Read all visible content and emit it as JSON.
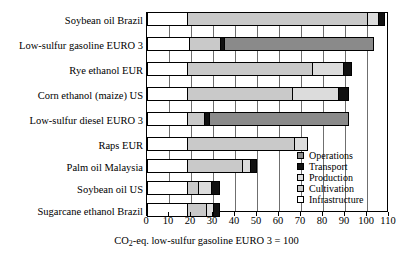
{
  "chart_data": {
    "type": "bar",
    "orientation": "horizontal",
    "stacked": true,
    "title": "",
    "xlabel": "CO2-eq. low-sulfur gasoline EURO 3 = 100",
    "xlabel_parts": {
      "pre": "CO",
      "sub": "2",
      "post": "-eq. low-sulfur gasoline EURO 3 = 100"
    },
    "ylabel": "",
    "xlim": [
      0,
      110
    ],
    "xticks": [
      0,
      10,
      20,
      30,
      40,
      50,
      60,
      70,
      80,
      90,
      100,
      110
    ],
    "xtick_labels": [
      "0",
      "10",
      "20",
      "30",
      "40",
      "50",
      "60",
      "70",
      "80",
      "90",
      "100",
      "110"
    ],
    "grid": true,
    "grid_axis": "x",
    "legend_position": "inside-right",
    "categories": [
      "Soybean oil Brazil",
      "Low-sulfur gasoline EURO 3",
      "Rye ethanol EUR",
      "Corn ethanol (maize) US",
      "Low-sulfur diesel EURO 3",
      "Raps EUR",
      "Palm oil Malaysia",
      "Soybean oil US",
      "Sugarcane ethanol Brazil"
    ],
    "series": [
      {
        "name": "Infrastructure",
        "color": "#ffffff",
        "values": [
          18,
          19,
          18,
          18,
          18,
          18,
          18,
          18,
          18
        ]
      },
      {
        "name": "Cultivation",
        "color": "#c9c9c9",
        "values": [
          82,
          14,
          57,
          48,
          8,
          49,
          25,
          5,
          9
        ]
      },
      {
        "name": "Production",
        "color": "#dcdcdc",
        "values": [
          5,
          0,
          14,
          21,
          0,
          6,
          4,
          6,
          3
        ]
      },
      {
        "name": "Transport",
        "color": "#111111",
        "values": [
          3,
          2,
          4,
          5,
          2,
          0,
          3,
          4,
          3
        ]
      },
      {
        "name": "Operations",
        "color": "#8a8a8a",
        "values": [
          0,
          68,
          0,
          0,
          64,
          0,
          0,
          0,
          0
        ]
      }
    ],
    "totals": [
      108,
      103,
      93,
      92,
      92,
      73,
      50,
      33,
      33
    ],
    "legend": [
      {
        "label": "Operations",
        "swatch": "#8a8a8a"
      },
      {
        "label": "Transport",
        "swatch": "#111111"
      },
      {
        "label": "Production",
        "swatch": "#dcdcdc"
      },
      {
        "label": "Cultivation",
        "swatch": "#c9c9c9"
      },
      {
        "label": "Infrastructure",
        "swatch": "#ffffff"
      }
    ]
  }
}
